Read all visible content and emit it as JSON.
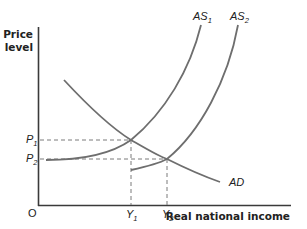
{
  "diagram": {
    "y_axis_label_line1": "Price",
    "y_axis_label_line2": "level",
    "x_axis_label": "Real national income",
    "origin_label": "O",
    "curves": {
      "as1": {
        "label": "AS",
        "subscript": "1"
      },
      "as2": {
        "label": "AS",
        "subscript": "2"
      },
      "ad": {
        "label": "AD"
      }
    },
    "price_levels": [
      {
        "label": "P",
        "subscript": "1"
      },
      {
        "label": "P",
        "subscript": "2"
      }
    ],
    "income_levels": [
      {
        "label": "Y",
        "subscript": "1"
      },
      {
        "label": "Y",
        "subscript": "2"
      }
    ],
    "equilibria": [
      {
        "curves": [
          "AS1",
          "AD"
        ],
        "price": "P1",
        "income": "Y1"
      },
      {
        "curves": [
          "AS2",
          "AD"
        ],
        "price": "P2",
        "income": "Y2"
      }
    ]
  }
}
